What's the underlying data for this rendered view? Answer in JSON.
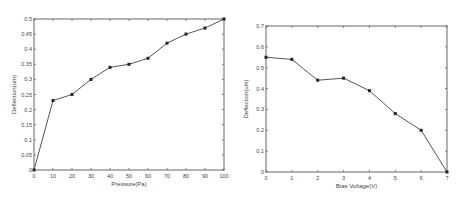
{
  "chart_data": [
    {
      "type": "line",
      "title": "",
      "xlabel": "Pressure(Pa)",
      "ylabel": "Deflection(um)",
      "x": [
        0,
        10,
        20,
        30,
        40,
        50,
        60,
        70,
        80,
        90,
        100
      ],
      "series": [
        {
          "name": "Deflection",
          "values": [
            0,
            0.23,
            0.25,
            0.3,
            0.34,
            0.35,
            0.37,
            0.42,
            0.45,
            0.47,
            0.5
          ]
        }
      ],
      "xlim": [
        0,
        100
      ],
      "ylim": [
        0,
        0.5
      ],
      "xticks": [
        "0",
        "10",
        "20",
        "30",
        "40",
        "50",
        "60",
        "70",
        "80",
        "90",
        "100"
      ],
      "yticks": [
        "0",
        "0.05",
        "0.1",
        "0.15",
        "0.2",
        "0.25",
        "0.3",
        "0.35",
        "0.4",
        "0.45",
        "0.5"
      ],
      "grid": false,
      "legend": null,
      "marker": "square",
      "line_color": "#555555"
    },
    {
      "type": "line",
      "title": "",
      "xlabel": "Bias Voltage(V)",
      "ylabel": "Deflection(um)",
      "x": [
        0,
        1,
        2,
        3,
        4,
        5,
        6,
        7
      ],
      "series": [
        {
          "name": "Deflection",
          "values": [
            0.55,
            0.54,
            0.44,
            0.45,
            0.39,
            0.28,
            0.2,
            0.0
          ]
        }
      ],
      "xlim": [
        0,
        7
      ],
      "ylim": [
        0,
        0.7
      ],
      "xticks": [
        "0",
        "1",
        "2",
        "3",
        "4",
        "5",
        "6",
        "7"
      ],
      "yticks": [
        "0",
        "0.1",
        "0.2",
        "0.3",
        "0.4",
        "0.5",
        "0.6",
        "0.7"
      ],
      "grid": false,
      "legend": null,
      "marker": "square",
      "line_color": "#555555"
    }
  ],
  "layout": {
    "charts": [
      {
        "plot": {
          "x0": 34,
          "y0": 19,
          "x1": 224,
          "y1": 170
        }
      },
      {
        "plot": {
          "x0": 266,
          "y0": 26,
          "x1": 447,
          "y1": 172
        }
      }
    ]
  }
}
